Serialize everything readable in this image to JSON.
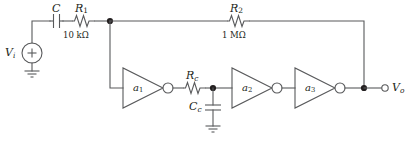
{
  "diagram": {
    "colors": {
      "wire": "#58595b",
      "node": "#231f20",
      "text": "#231f20",
      "background": "#ffffff"
    }
  },
  "source": {
    "label": "V",
    "label_sub": "i",
    "polarity": "+",
    "name": "input-voltage-source"
  },
  "components": {
    "input_cap": {
      "ref": "C",
      "ref_sub": "",
      "value": "",
      "type": "capacitor"
    },
    "r1": {
      "ref": "R",
      "ref_sub": "1",
      "value": "10 kΩ",
      "type": "resistor"
    },
    "r2": {
      "ref": "R",
      "ref_sub": "2",
      "value": "1 MΩ",
      "type": "resistor"
    },
    "rc": {
      "ref": "R",
      "ref_sub": "c",
      "value": "",
      "type": "resistor"
    },
    "cc": {
      "ref": "C",
      "ref_sub": "c",
      "value": "",
      "type": "capacitor"
    }
  },
  "amplifiers": [
    {
      "label": "a",
      "label_sub": "1",
      "inverting": true,
      "name": "amplifier-a1"
    },
    {
      "label": "a",
      "label_sub": "2",
      "inverting": true,
      "name": "amplifier-a2"
    },
    {
      "label": "a",
      "label_sub": "3",
      "inverting": true,
      "name": "amplifier-a3"
    }
  ],
  "output": {
    "label": "V",
    "label_sub": "o",
    "name": "output-terminal"
  },
  "grounds": [
    {
      "name": "ground-source"
    },
    {
      "name": "ground-cc"
    }
  ]
}
